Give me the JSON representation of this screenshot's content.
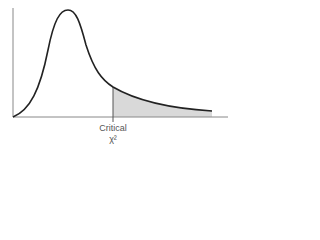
{
  "diagram": {
    "critical_label": "Critical",
    "critical_symbol": "χ²",
    "colors": {
      "curve": "#222222",
      "axis": "#777777",
      "shaded_region": "#d9d9d9"
    }
  }
}
